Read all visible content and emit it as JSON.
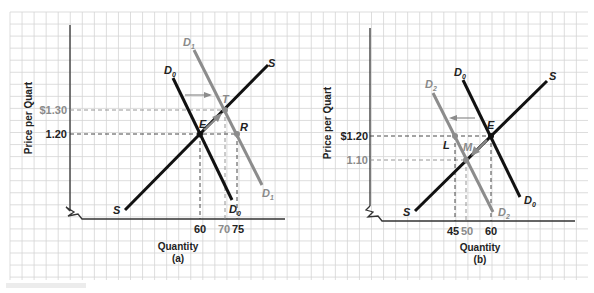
{
  "colors": {
    "primary": "#111111",
    "shifted": "#8c8c8c",
    "grid": "#d4d4d4",
    "background": "#ffffff"
  },
  "panel_a": {
    "caption": "(a)",
    "y_axis_label": "Price per Quart",
    "x_axis_label": "Quantity",
    "price_ticks": [
      {
        "label": "$1.30",
        "value": 1.3,
        "style": "gray"
      },
      {
        "label": "1.20",
        "value": 1.2,
        "style": "black"
      }
    ],
    "quantity_ticks": [
      {
        "label": "60",
        "value": 60,
        "style": "black"
      },
      {
        "label": "70",
        "value": 70,
        "style": "gray"
      },
      {
        "label": "75",
        "value": 75,
        "style": "black"
      }
    ],
    "curves": {
      "supply": {
        "label": "S"
      },
      "demand_original": {
        "label": "D",
        "subscript": "0"
      },
      "demand_new": {
        "label": "D",
        "subscript": "1"
      }
    },
    "points": {
      "E": "E",
      "T": "T",
      "R": "R"
    },
    "shift_arrow": "right"
  },
  "panel_b": {
    "caption": "(b)",
    "y_axis_label": "Price per Quart",
    "x_axis_label": "Quantity",
    "price_ticks": [
      {
        "label": "$1.20",
        "value": 1.2,
        "style": "black"
      },
      {
        "label": "1.10",
        "value": 1.1,
        "style": "gray"
      }
    ],
    "quantity_ticks": [
      {
        "label": "45",
        "value": 45,
        "style": "black"
      },
      {
        "label": "50",
        "value": 50,
        "style": "gray"
      },
      {
        "label": "60",
        "value": 60,
        "style": "black"
      }
    ],
    "curves": {
      "supply": {
        "label": "S"
      },
      "demand_original": {
        "label": "D",
        "subscript": "0"
      },
      "demand_new": {
        "label": "D",
        "subscript": "2"
      }
    },
    "points": {
      "E": "E",
      "L": "L",
      "M": "M"
    },
    "shift_arrow": "left"
  }
}
